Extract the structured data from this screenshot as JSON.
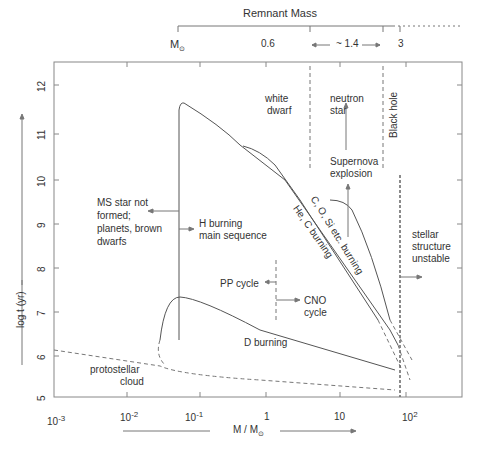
{
  "remnant_mass": {
    "title": "Remnant Mass",
    "msun_label": "M",
    "values": [
      "0.6",
      "~ 1.4",
      "3"
    ]
  },
  "axes": {
    "x_label": "M / M",
    "y_label": "log t (yr)",
    "x_ticks": [
      {
        "base": "10",
        "exp": "-3"
      },
      {
        "base": "10",
        "exp": "-2"
      },
      {
        "base": "10",
        "exp": "-1"
      },
      {
        "base": "1",
        "exp": ""
      },
      {
        "base": "10",
        "exp": ""
      },
      {
        "base": "10",
        "exp": "2"
      }
    ],
    "y_ticks": [
      "12",
      "11",
      "10",
      "9",
      "8",
      "7",
      "6",
      "5"
    ]
  },
  "regions": {
    "white_dwarf": [
      "white",
      "dwarf"
    ],
    "neutron_star": [
      "neutron",
      "star"
    ],
    "black_hole": "Black hole",
    "supernova": [
      "Supernova",
      "explosion"
    ],
    "ms_not_formed": [
      "MS star not",
      "formed;",
      "planets, brown",
      "dwarfs"
    ],
    "h_burning": [
      "H burning",
      "main sequence"
    ],
    "he_c_burning": "He, C burning",
    "cosi_burning": "C, O, Si etc. burning",
    "stellar_unstable": [
      "stellar",
      "structure",
      "unstable"
    ],
    "pp_cycle": "PP cycle",
    "cno_cycle": [
      "CNO",
      "cycle"
    ],
    "d_burning": "D burning",
    "protostellar": [
      "protostellar",
      "cloud"
    ]
  },
  "colors": {
    "line": "#555555",
    "text": "#333333"
  }
}
